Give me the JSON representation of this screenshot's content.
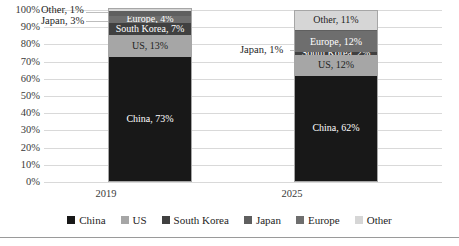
{
  "chart_data": {
    "type": "bar",
    "stacked": true,
    "title": "",
    "subtitle": "",
    "xlabel": "",
    "ylabel": "",
    "ylim": [
      0,
      100
    ],
    "grid": true,
    "legend_position": "bottom",
    "categories": [
      "2019",
      "2025"
    ],
    "ytick_labels": [
      "100%",
      "90%",
      "80%",
      "70%",
      "60%",
      "50%",
      "40%",
      "30%",
      "20%",
      "10%",
      "0%"
    ],
    "ytick_values": [
      100,
      90,
      80,
      70,
      60,
      50,
      40,
      30,
      20,
      10,
      0
    ],
    "stack_order_bottom_to_top": [
      "China",
      "US",
      "South Korea",
      "Europe",
      "Japan",
      "Other"
    ],
    "series": [
      {
        "name": "China",
        "color": "#181818",
        "values": [
          73,
          62
        ]
      },
      {
        "name": "US",
        "color": "#a6a6a6",
        "values": [
          13,
          12
        ]
      },
      {
        "name": "South Korea",
        "color": "#404040",
        "values": [
          7,
          2
        ]
      },
      {
        "name": "Japan",
        "color": "#5f5f5f",
        "values": [
          3,
          1
        ]
      },
      {
        "name": "Europe",
        "color": "#6e6e6e",
        "values": [
          4,
          12
        ]
      },
      {
        "name": "Other",
        "color": "#d6d6d6",
        "values": [
          1,
          11
        ]
      }
    ],
    "data_labels": {
      "2019": {
        "China": "China, 73%",
        "US": "US, 13%",
        "South Korea": "South Korea, 7%",
        "Europe": "Europe, 4%",
        "Japan": "Japan, 3%",
        "Other": "Other, 1%"
      },
      "2025": {
        "China": "China, 62%",
        "US": "US, 12%",
        "South Korea": "South Korea, 2%",
        "Europe": "Europe, 12%",
        "Japan": "Japan, 1%",
        "Other": "Other, 11%"
      }
    },
    "callouts": [
      {
        "text": "Other, 1%",
        "category": "2019",
        "series": "Other"
      },
      {
        "text": "Japan, 3%",
        "category": "2019",
        "series": "Japan"
      },
      {
        "text": "Japan, 1%",
        "category": "2025",
        "series": "Japan"
      }
    ]
  },
  "legend": {
    "items": [
      {
        "label": "China",
        "color": "#181818"
      },
      {
        "label": "US",
        "color": "#a6a6a6"
      },
      {
        "label": "South Korea",
        "color": "#404040"
      },
      {
        "label": "Japan",
        "color": "#5f5f5f"
      },
      {
        "label": "Europe",
        "color": "#6e6e6e"
      },
      {
        "label": "Other",
        "color": "#d6d6d6"
      }
    ]
  }
}
